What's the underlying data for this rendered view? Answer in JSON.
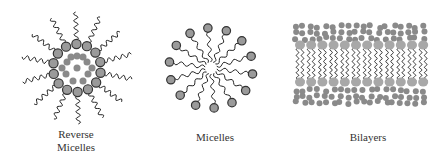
{
  "figure": {
    "panels": [
      {
        "id": "reverse-micelles",
        "label_line1": "Reverse",
        "label_line2": "Micelles"
      },
      {
        "id": "micelles",
        "label": "Micelles"
      },
      {
        "id": "bilayers",
        "label": "Bilayers"
      }
    ],
    "colors": {
      "head_fill": "#9a9a9a",
      "head_stroke": "#333333",
      "water_fill": "#8a8a8a",
      "tail": "#222222",
      "text": "#333333"
    }
  }
}
